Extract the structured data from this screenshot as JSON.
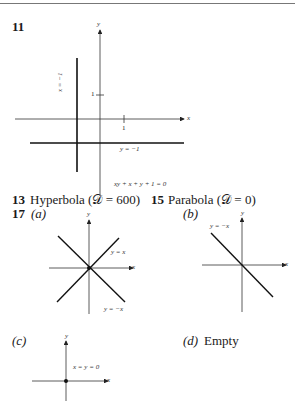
{
  "problems": {
    "p11": {
      "number": "11",
      "graph": {
        "x_axis_label": "x",
        "y_axis_label": "y",
        "tick_x": "1",
        "tick_y": "1",
        "line_vertical_label": "x = −1",
        "line_horizontal_label": "y = −1",
        "equation": "xy + x + y + 1 = 0"
      }
    },
    "p13": {
      "number": "13",
      "answer": "Hyperbola (𝒟 = 600)"
    },
    "p15": {
      "number": "15",
      "answer": "Parabola (𝒟 = 0)"
    },
    "p17": {
      "number": "17",
      "a": {
        "label": "(a)",
        "x_axis_label": "x",
        "y_axis_label": "y",
        "line1": "y = x",
        "line2": "y = −x"
      },
      "b": {
        "label": "(b)",
        "x_axis_label": "x",
        "y_axis_label": "y",
        "line1": "y = −x"
      },
      "c": {
        "label": "(c)",
        "x_axis_label": "x",
        "y_axis_label": "y",
        "point": "x = y = 0"
      },
      "d": {
        "label": "(d)",
        "answer": "Empty"
      }
    }
  }
}
